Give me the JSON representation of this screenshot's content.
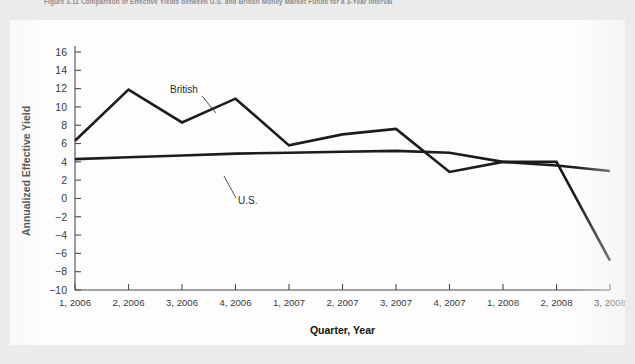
{
  "caption": {
    "text": "Figure 3.11  Comparison of Effective Yields between U.S. and British Money Market Funds for a 3-Year Interval"
  },
  "chart_data": {
    "type": "line",
    "title": "",
    "xlabel": "Quarter, Year",
    "ylabel": "Annualized Effective Yield",
    "categories": [
      "1, 2006",
      "2, 2006",
      "3, 2006",
      "4, 2006",
      "1, 2007",
      "2, 2007",
      "3, 2007",
      "4, 2007",
      "1, 2008",
      "2, 2008",
      "3, 2008"
    ],
    "series": [
      {
        "name": "British",
        "values": [
          6.3,
          11.9,
          8.3,
          10.9,
          5.8,
          7.0,
          7.6,
          2.9,
          4.0,
          4.0,
          -6.8
        ]
      },
      {
        "name": "U.S.",
        "values": [
          4.3,
          4.5,
          4.7,
          4.9,
          5.0,
          5.1,
          5.2,
          5.0,
          4.0,
          3.6,
          3.0
        ]
      }
    ],
    "ylim": [
      -10,
      16
    ],
    "yticks": [
      -10,
      -8,
      -6,
      -4,
      -2,
      0,
      2,
      4,
      6,
      8,
      10,
      12,
      14,
      16
    ],
    "ytick_labels": [
      "−10",
      "−8",
      "−6",
      "−4",
      "−2",
      "0",
      "2",
      "4",
      "6",
      "8",
      "10",
      "12",
      "14",
      "16"
    ],
    "grid": false,
    "legend_position": "inline-annotations",
    "annotations": [
      {
        "label": "British",
        "x": 170,
        "y": 89
      },
      {
        "label": "U.S.",
        "x": 236,
        "y": 180
      }
    ],
    "line_color": "#1c1c1c",
    "background_color": "#fdfdfd",
    "page_background_color": "#ebebeb",
    "axis_color": "#4a4a4a"
  }
}
